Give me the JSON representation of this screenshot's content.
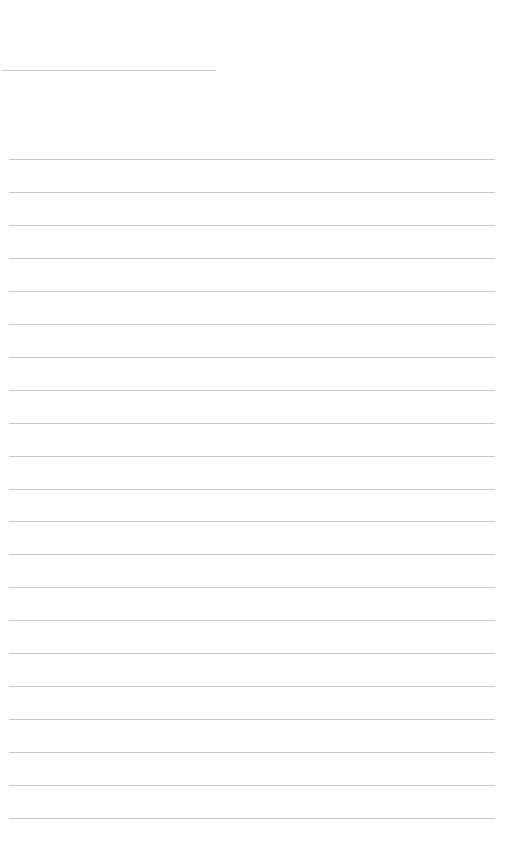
{
  "page": {
    "type": "blank-ruled-sheet",
    "background_color": "#ffffff",
    "line_color": "#c8c8c8",
    "header_line": {
      "y": 70,
      "x_start": 2,
      "x_end": 216
    },
    "ruled_lines": {
      "count": 21,
      "first_y": 159,
      "spacing": 32.95,
      "x_start": 9,
      "x_end": 495
    },
    "text_content": []
  }
}
